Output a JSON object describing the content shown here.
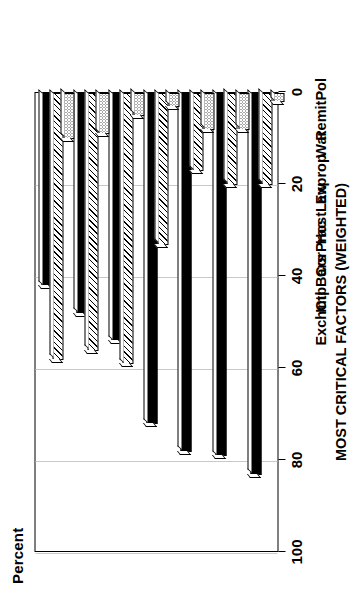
{
  "chart_data": {
    "type": "bar",
    "orientation": "horizontal-rotated",
    "title": "",
    "xlabel": "MOST CRITICAL FACTORS (WEIGHTED)",
    "ylabel": "Percent",
    "ylim": [
      0,
      100
    ],
    "yticks": [
      "0",
      "20",
      "40",
      "60",
      "80",
      "100"
    ],
    "grid": true,
    "legend_position": "bottom",
    "categories": [
      "RemitPol",
      "War",
      "Exprop",
      "HostLaw",
      "CorPrac",
      "ImpBars",
      "ExchCtl"
    ],
    "series": [
      {
        "name": "Critical",
        "values": [
          83,
          79,
          78,
          72,
          54,
          48,
          42
        ]
      },
      {
        "name": "Moderate",
        "values": [
          20,
          20,
          17,
          33,
          59,
          56,
          58
        ]
      },
      {
        "name": "Negligible",
        "values": [
          2,
          8,
          8,
          3,
          5,
          9,
          10
        ]
      }
    ]
  },
  "axis": {
    "y_label": "Percent",
    "x_title": "MOST CRITICAL FACTORS (WEIGHTED)",
    "tick_labels": [
      "100",
      "80",
      "60",
      "40",
      "20",
      "0"
    ]
  },
  "legend": {
    "items": [
      {
        "label": "Critical",
        "pattern": "solid-black"
      },
      {
        "label": "Moderate",
        "pattern": "diagonal-hatch"
      },
      {
        "label": "Negligible",
        "pattern": "dotted"
      }
    ]
  },
  "colors": {
    "critical": "#000000",
    "moderate": "#ffffff",
    "negligible": "#ffffff",
    "grid": "#c9c9c9",
    "axis": "#000000"
  }
}
